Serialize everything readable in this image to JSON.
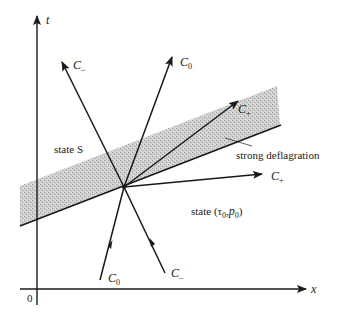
{
  "diagram": {
    "type": "characteristics-diagram",
    "axes": {
      "vertical_label": "t",
      "horizontal_label": "x",
      "origin_label": "0"
    },
    "regions": {
      "upper_left": "state S",
      "lower_right_prefix": "state (",
      "lower_right_tau": "τ",
      "lower_right_p": "p",
      "lower_right_sub": "0",
      "shaded_band_label": "strong deflagration"
    },
    "characteristics": [
      {
        "id": "upper-c-minus",
        "base": "C",
        "sub": "–",
        "direction": "outgoing"
      },
      {
        "id": "upper-c-zero",
        "base": "C",
        "sub": "0",
        "direction": "outgoing"
      },
      {
        "id": "band-c-plus",
        "base": "C",
        "sub": "+",
        "direction": "outgoing"
      },
      {
        "id": "right-c-plus",
        "base": "C",
        "sub": "+",
        "direction": "outgoing"
      },
      {
        "id": "lower-c-zero",
        "base": "C",
        "sub": "0",
        "direction": "incoming"
      },
      {
        "id": "lower-c-minus",
        "base": "C",
        "sub": "–",
        "direction": "incoming"
      }
    ],
    "colors": {
      "line": "#1a1a1a",
      "band_fill": "#c8c8c8"
    }
  }
}
